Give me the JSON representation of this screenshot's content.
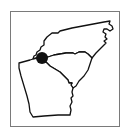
{
  "map": {
    "title": "Southeastern US states",
    "frame_color": "#7a7a7a",
    "stroke_color": "#111111",
    "regions": [
      {
        "name": "North Carolina",
        "id": "nc"
      },
      {
        "name": "South Carolina",
        "id": "sc"
      },
      {
        "name": "Georgia",
        "id": "ga"
      }
    ],
    "marker": {
      "label": "Tri-state junction",
      "color": "#111111",
      "cx": 42,
      "cy": 58,
      "r": 6
    }
  }
}
